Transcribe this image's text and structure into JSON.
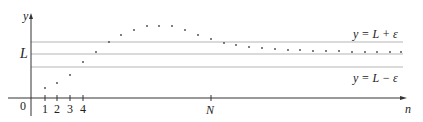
{
  "figure": {
    "axis_labels": {
      "y": "y",
      "x": "n",
      "origin": "0"
    },
    "y_tick_label": "L",
    "x_tick_labels": [
      "1",
      "2",
      "3",
      "4"
    ],
    "x_special_tick": "N",
    "band_labels": {
      "upper": "y = L + ε",
      "lower": "y = L − ε"
    },
    "colors": {
      "axis": "#333333",
      "band_line": "#b5b5b5",
      "dot": "#444444",
      "text": "#222222"
    }
  },
  "chart_data": {
    "type": "scatter",
    "title": "",
    "xlabel": "n",
    "ylabel": "y",
    "reference_lines": [
      {
        "name": "y = L + ε",
        "y_px": 42
      },
      {
        "name": "y = L",
        "y_px": 54
      },
      {
        "name": "y = L − ε",
        "y_px": 67
      }
    ],
    "points_px": [
      [
        45,
        88
      ],
      [
        57,
        83
      ],
      [
        70,
        75
      ],
      [
        83,
        62
      ],
      [
        96,
        52
      ],
      [
        109,
        42
      ],
      [
        121,
        35
      ],
      [
        134,
        30
      ],
      [
        147,
        26
      ],
      [
        159,
        26
      ],
      [
        172,
        26
      ],
      [
        185,
        30
      ],
      [
        198,
        35
      ],
      [
        211,
        39
      ],
      [
        224,
        43
      ],
      [
        236,
        45
      ],
      [
        249,
        47
      ],
      [
        262,
        48
      ],
      [
        275,
        49
      ],
      [
        288,
        50
      ],
      [
        300,
        50
      ],
      [
        313,
        51
      ],
      [
        326,
        51
      ],
      [
        339,
        51
      ],
      [
        352,
        52
      ],
      [
        365,
        52
      ],
      [
        377,
        52
      ],
      [
        390,
        52
      ],
      [
        401,
        52
      ]
    ],
    "x_ticks": [
      "1",
      "2",
      "3",
      "4",
      "N"
    ],
    "legend": "none",
    "grid": false
  }
}
